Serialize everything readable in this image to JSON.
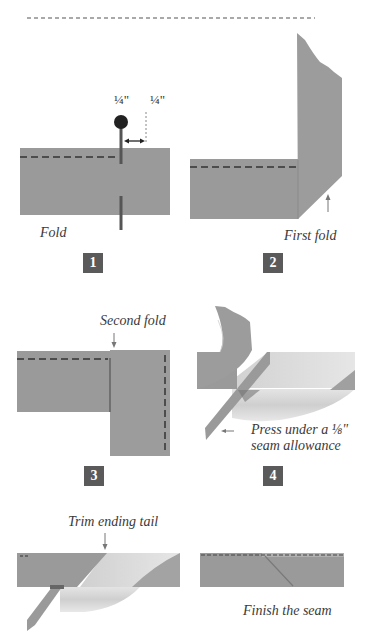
{
  "colors": {
    "fabric": "#9a9a9a",
    "fabric_dark": "#8c8c8c",
    "fabric_light": "#d6d6d6",
    "stitch": "#333333",
    "pin": "#222222",
    "step_box": "#5a5a5a",
    "arrow": "#777777"
  },
  "panels": [
    {
      "step": "1",
      "labels": {
        "caption": "Fold",
        "measure_left": "¼\"",
        "measure_right": "¼\""
      }
    },
    {
      "step": "2",
      "labels": {
        "caption": "First fold"
      }
    },
    {
      "step": "3",
      "labels": {
        "caption": "Second fold"
      }
    },
    {
      "step": "4",
      "labels": {
        "caption_line1": "Press under a ⅛\"",
        "caption_line2": "seam allowance"
      }
    },
    {
      "step": "",
      "labels": {
        "caption": "Trim ending tail"
      }
    },
    {
      "step": "",
      "labels": {
        "caption": "Finish the seam"
      }
    }
  ]
}
